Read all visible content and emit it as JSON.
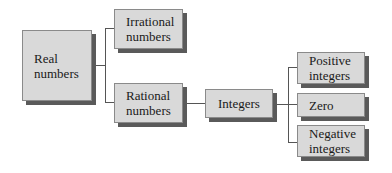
{
  "diagram": {
    "nodes": {
      "real": "Real numbers",
      "irrational": "Irrational numbers",
      "rational": "Rational numbers",
      "integers": "Integers",
      "positive": "Positive integers",
      "zero": "Zero",
      "negative": "Negative integers"
    },
    "edges": [
      [
        "Real numbers",
        "Irrational numbers"
      ],
      [
        "Real numbers",
        "Rational numbers"
      ],
      [
        "Rational numbers",
        "Integers"
      ],
      [
        "Integers",
        "Positive integers"
      ],
      [
        "Integers",
        "Zero"
      ],
      [
        "Integers",
        "Negative integers"
      ]
    ]
  }
}
